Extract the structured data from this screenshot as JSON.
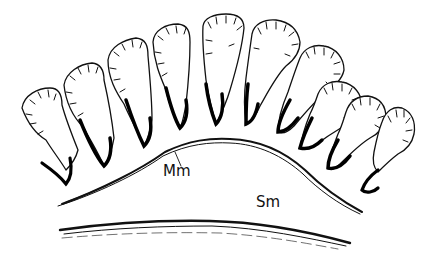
{
  "figure": {
    "labels": {
      "muscularis_mucosae": "Mm",
      "submucosa": "Sm"
    },
    "colors": {
      "ink": "#111111",
      "background": "#ffffff"
    },
    "glands": [
      {
        "index": 1,
        "top_x": 42,
        "top_y": 95,
        "base_x": 70,
        "base_y": 185,
        "angle": -22
      },
      {
        "index": 2,
        "top_x": 88,
        "top_y": 72,
        "base_x": 108,
        "base_y": 165,
        "angle": -18
      },
      {
        "index": 3,
        "top_x": 133,
        "top_y": 48,
        "base_x": 146,
        "base_y": 145,
        "angle": -12
      },
      {
        "index": 4,
        "top_x": 177,
        "top_y": 33,
        "base_x": 180,
        "base_y": 128,
        "angle": -7
      },
      {
        "index": 5,
        "top_x": 223,
        "top_y": 22,
        "base_x": 214,
        "base_y": 123,
        "angle": 0
      },
      {
        "index": 6,
        "top_x": 270,
        "top_y": 25,
        "base_x": 246,
        "base_y": 123,
        "angle": 7
      },
      {
        "index": 7,
        "top_x": 310,
        "top_y": 50,
        "base_x": 279,
        "base_y": 130,
        "angle": 13
      },
      {
        "index": 8,
        "top_x": 345,
        "top_y": 84,
        "base_x": 307,
        "base_y": 148,
        "angle": 20
      },
      {
        "index": 9,
        "top_x": 372,
        "top_y": 115,
        "base_x": 333,
        "base_y": 170,
        "angle": 26
      },
      {
        "index": 10,
        "top_x": 400,
        "top_y": 128,
        "base_x": 365,
        "base_y": 190,
        "angle": 32
      }
    ]
  }
}
